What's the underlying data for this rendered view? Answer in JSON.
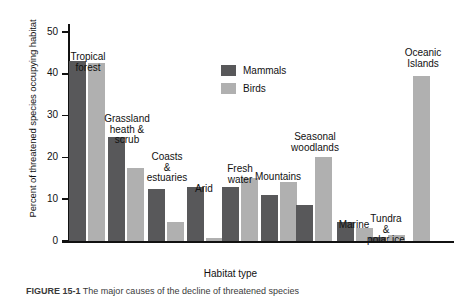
{
  "chart_data": {
    "type": "bar",
    "title": "",
    "xlabel": "Habitat type",
    "ylabel": "Percent of threatened species occupying habitat",
    "ylim": [
      0,
      52
    ],
    "yticks": [
      0,
      10,
      20,
      30,
      40,
      50
    ],
    "ytick_labels": [
      "0",
      "10",
      "20",
      "30",
      "40",
      "50"
    ],
    "grid": false,
    "legend_position": "upper-center",
    "categories": [
      "Tropical forest",
      "Grassland heath & scrub",
      "Coasts & estuaries",
      "Arid",
      "Fresh water",
      "Mountains",
      "Seasonal woodlands",
      "Marine",
      "Tundra & polar ice",
      "Oceanic Islands"
    ],
    "category_labels": [
      "Tropical\nforest",
      "Grassland\nheath &\nscrub",
      "Coasts\n&\nestuaries",
      "Arid",
      "Fresh\nwater",
      "Mountains",
      "Seasonal\nwoodlands",
      "Marine",
      "Tundra\n&\npolar ice",
      "Oceanic\nIslands"
    ],
    "series": [
      {
        "name": "Mammals",
        "color": "#58585a",
        "values": [
          43,
          25,
          12.5,
          13,
          13,
          11,
          8.5,
          4.5,
          1,
          null
        ]
      },
      {
        "name": "Birds",
        "color": "#b0b0b0",
        "values": [
          42.5,
          17.5,
          4.5,
          0.7,
          15,
          14,
          20,
          3,
          1.5,
          39.5
        ]
      }
    ]
  },
  "legend": {
    "items": [
      {
        "label": "Mammals",
        "color": "#58585a"
      },
      {
        "label": "Birds",
        "color": "#b0b0b0"
      }
    ]
  },
  "caption": {
    "figure_number": "FIGURE 15-1",
    "text": "The major causes of the decline of threatened species"
  }
}
